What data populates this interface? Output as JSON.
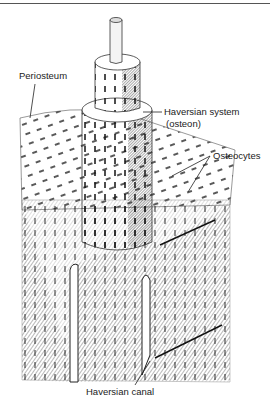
{
  "figure": {
    "labels": {
      "periosteum": "Periosteum",
      "haversian_system": "Haversian system",
      "osteon": "(osteon)",
      "osteocytes": "Osteocytes",
      "haversian_canal": "Haversian canal"
    }
  }
}
